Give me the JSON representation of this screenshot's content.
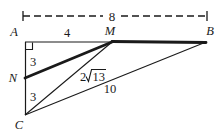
{
  "figure": {
    "background_color": "#ffffff",
    "stroke_color": "#1a1a1a",
    "thin_stroke_width": 1.1,
    "bold_stroke_width": 2.6,
    "dash_pattern": "7 4"
  },
  "vertices": [
    {
      "name": "A",
      "label": "A",
      "x": 25,
      "y": 42,
      "label_x": 14,
      "label_y": 36
    },
    {
      "name": "M",
      "label": "M",
      "x": 112,
      "y": 42,
      "label_x": 106,
      "label_y": 35
    },
    {
      "name": "B",
      "label": "B",
      "x": 206,
      "y": 42,
      "label_x": 207,
      "label_y": 35
    },
    {
      "name": "N",
      "label": "N",
      "x": 25,
      "y": 78,
      "label_x": 11,
      "label_y": 81
    },
    {
      "name": "C",
      "label": "C",
      "x": 25,
      "y": 115,
      "label_x": 17,
      "label_y": 128
    }
  ],
  "segments": [
    {
      "name": "segment-A-M",
      "from": "A",
      "to": "M",
      "weight": "thin"
    },
    {
      "name": "segment-M-B",
      "from": "M",
      "to": "B",
      "weight": "bold"
    },
    {
      "name": "segment-A-C",
      "from": "A",
      "to": "C",
      "weight": "thin"
    },
    {
      "name": "segment-N-M",
      "from": "N",
      "to": "M",
      "weight": "bold"
    },
    {
      "name": "segment-C-M",
      "from": "C",
      "to": "M",
      "weight": "thin"
    },
    {
      "name": "segment-C-B",
      "from": "C",
      "to": "B",
      "weight": "thin"
    }
  ],
  "right_angle": {
    "at": "A",
    "size": 6
  },
  "dimension": {
    "label": "8",
    "label_x": 112,
    "label_y": 20,
    "line_y": 16,
    "x_start": 23,
    "x_end": 207,
    "tick_half_height": 5
  },
  "measures": [
    {
      "name": "label-AM",
      "text": "4",
      "x": 67,
      "y": 36,
      "for": "segment-A-M"
    },
    {
      "name": "label-AN",
      "text": "3",
      "x": 32,
      "y": 65,
      "for": "segment-A-N"
    },
    {
      "name": "label-NC",
      "text": "3",
      "x": 32,
      "y": 100,
      "for": "segment-N-C"
    },
    {
      "name": "label-CB",
      "text": "10",
      "x": 105,
      "y": 92,
      "for": "segment-C-B"
    }
  ],
  "radical_measure": {
    "name": "label-CM",
    "coefficient": "2",
    "radical_glyph": "√",
    "radicand": "13",
    "full_text": "2√13",
    "x": 80,
    "y": 80,
    "for": "segment-C-M"
  }
}
